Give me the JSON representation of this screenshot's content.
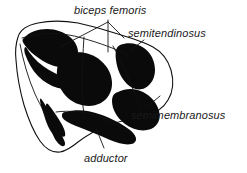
{
  "figure": {
    "name": "muscle-cross-section",
    "background_color": "#ffffff",
    "ink_color": "#0a0a0a",
    "outline_color": "#111111",
    "label_color": "#1a1a1a"
  },
  "labels": [
    {
      "id": "biceps-femoris",
      "text": "biceps femoris",
      "x": 74,
      "y": 4
    },
    {
      "id": "semitendinosus",
      "text": "semitendinosus",
      "x": 128,
      "y": 27
    },
    {
      "id": "semimembranosus",
      "text": "semimembranosus",
      "x": 131,
      "y": 109
    },
    {
      "id": "adductor",
      "text": "adductor",
      "x": 84,
      "y": 152
    }
  ]
}
